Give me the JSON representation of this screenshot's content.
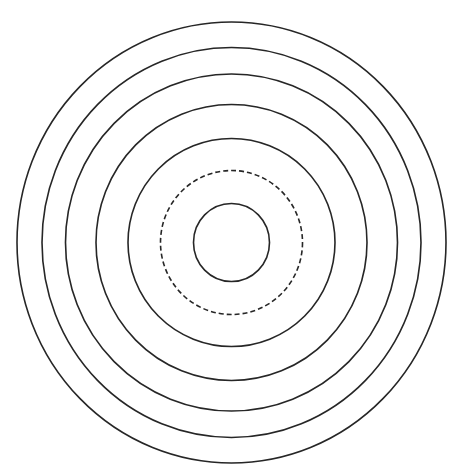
{
  "diagram": {
    "title": "",
    "stroke_color": "#262626",
    "background_color": "#ffffff",
    "rings": [
      {
        "index": 1,
        "style": "solid"
      },
      {
        "index": 2,
        "style": "dashed"
      },
      {
        "index": 3,
        "style": "solid"
      },
      {
        "index": 4,
        "style": "solid"
      },
      {
        "index": 5,
        "style": "solid"
      },
      {
        "index": 6,
        "style": "solid"
      },
      {
        "index": 7,
        "style": "solid"
      }
    ]
  }
}
